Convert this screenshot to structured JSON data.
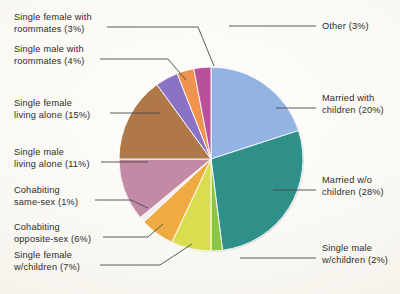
{
  "chart_data": {
    "type": "pie",
    "title": "",
    "subtitle": "",
    "xlabel": "",
    "ylabel": "",
    "legend_position": "callout-labels",
    "grid": false,
    "units": "percent",
    "total": 100,
    "start_angle_deg": 0,
    "direction": "clockwise",
    "categories": [
      "Married with children",
      "Married w/o children",
      "Single male w/children",
      "Single female w/children",
      "Cohabiting opposite-sex",
      "Cohabiting same-sex",
      "Single male living alone",
      "Single female living alone",
      "Single male with roommates",
      "Single female with roommates",
      "Other"
    ],
    "values": [
      20,
      28,
      2,
      7,
      6,
      1,
      11,
      15,
      4,
      3,
      3
    ],
    "colors": [
      "#93b4e2",
      "#2e9089",
      "#8cc63f",
      "#d8de4f",
      "#edab42",
      "#f2eef2",
      "#c38aa5",
      "#b07848",
      "#8a72c4",
      "#f0934e",
      "#b8519a"
    ],
    "slices": [
      {
        "label": "Married with children",
        "value": 20,
        "color": "#93b4e2"
      },
      {
        "label": "Married w/o children",
        "value": 28,
        "color": "#2e9089"
      },
      {
        "label": "Single male w/children",
        "value": 2,
        "color": "#8cc63f"
      },
      {
        "label": "Single female w/children",
        "value": 7,
        "color": "#d8de4f"
      },
      {
        "label": "Cohabiting opposite-sex",
        "value": 6,
        "color": "#edab42"
      },
      {
        "label": "Cohabiting same-sex",
        "value": 1,
        "color": "#f2eef2"
      },
      {
        "label": "Single male living alone",
        "value": 11,
        "color": "#c38aa5"
      },
      {
        "label": "Single female living alone",
        "value": 15,
        "color": "#b07848"
      },
      {
        "label": "Single male with roommates",
        "value": 4,
        "color": "#8a72c4"
      },
      {
        "label": "Single female with roommates",
        "value": 3,
        "color": "#f0934e"
      },
      {
        "label": "Other",
        "value": 3,
        "color": "#b8519a"
      }
    ]
  },
  "callouts": {
    "single_female_roommates": "Single female with\nroommates (3%)",
    "single_male_roommates": "Single male with\nroommates (4%)",
    "single_female_alone": "Single female\nliving alone (15%)",
    "single_male_alone": "Single male\nliving alone (11%)",
    "cohabiting_same_sex": "Cohabiting\nsame-sex (1%)",
    "cohabiting_opposite_sex": "Cohabiting\nopposite-sex (6%)",
    "single_female_children": "Single female\nw/children (7%)",
    "other": "Other (3%)",
    "married_with_children": "Married with\nchildren (20%)",
    "married_wo_children": "Married w/o\nchildren (28%)",
    "single_male_children": "Single male\nw/children (2%)"
  },
  "style": {
    "leader_line_color": "#4a4a4a",
    "background_color": "#faf8f3",
    "text_color": "#2b2b2b",
    "pie_shadow_color": "#b9b9b9"
  }
}
